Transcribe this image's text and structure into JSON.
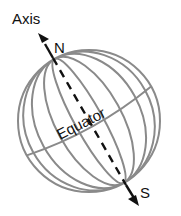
{
  "diagram": {
    "type": "globe-axis",
    "labels": {
      "axis": "Axis",
      "north": "N",
      "south": "S",
      "equator": "Equator"
    },
    "colors": {
      "grid": "#8a8a8a",
      "axis": "#111111",
      "text": "#111111",
      "background": "#ffffff"
    }
  }
}
